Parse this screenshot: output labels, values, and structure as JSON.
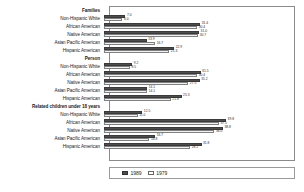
{
  "chart_data": {
    "type": "bar",
    "orientation": "horizontal",
    "title": "",
    "xlabel": "",
    "ylabel": "",
    "xlim": [
      0,
      60
    ],
    "grid": false,
    "legend_position": "bottom",
    "legend": [
      "1989",
      "1979"
    ],
    "series": [
      {
        "name": "1989",
        "color": "#4d4d4d"
      },
      {
        "name": "1979",
        "color": "#ffffff"
      }
    ],
    "groups": [
      {
        "header": "Families",
        "rows": [
          {
            "category": "Non-Hispanic White",
            "v1989": 7.0,
            "v1979": 6.0,
            "l1989": "7.0",
            "l1979": "6.0"
          },
          {
            "category": "African American",
            "v1989": 31.4,
            "v1979": 30.4,
            "l1989": "31.4",
            "l1979": "30.4"
          },
          {
            "category": "Native American",
            "v1989": 31.0,
            "v1979": 30.7,
            "l1989": "31.0",
            "l1979": "30.7"
          },
          {
            "category": "Asian Pacific American",
            "v1989": 13.9,
            "v1979": 16.7,
            "l1989": "13.9",
            "l1979": "16.7"
          },
          {
            "category": "Hispanic American",
            "v1989": 22.9,
            "v1979": 21.3,
            "l1989": "22.9",
            "l1979": "21.3"
          }
        ]
      },
      {
        "header": "Person",
        "rows": [
          {
            "category": "Non-Hispanic White",
            "v1989": 9.2,
            "v1979": 8.5,
            "l1989": "9.2",
            "l1979": "8.5"
          },
          {
            "category": "African American",
            "v1989": 31.5,
            "v1979": 30.4,
            "l1989": "31.5",
            "l1979": "30.4"
          },
          {
            "category": "Native American",
            "v1989": 31.2,
            "v1979": 27.5,
            "l1989": "31.2",
            "l1979": "27.5"
          },
          {
            "category": "Asian Pacific American",
            "v1989": 14.1,
            "v1979": 14.1,
            "l1989": "14.1",
            "l1979": "14.1"
          },
          {
            "category": "Hispanic American",
            "v1989": 25.3,
            "v1979": 21.8,
            "l1989": "25.3",
            "l1979": "21.8"
          }
        ]
      },
      {
        "header": "Related children under 18 years",
        "rows": [
          {
            "category": "Non-Hispanic White",
            "v1989": 12.5,
            "v1979": 11.0,
            "l1989": "12.5",
            "l1979": "11.0"
          },
          {
            "category": "African American",
            "v1989": 39.8,
            "v1979": 37.5,
            "l1989": "39.8",
            "l1979": "37.5"
          },
          {
            "category": "Native American",
            "v1989": 38.8,
            "v1979": 36.0,
            "l1989": "38.8",
            "l1979": "36.0"
          },
          {
            "category": "Asian Pacific American",
            "v1989": 16.7,
            "v1979": 14.8,
            "l1989": "16.7",
            "l1979": "14.8"
          },
          {
            "category": "Hispanic American",
            "v1989": 31.8,
            "v1979": 28.1,
            "l1989": "31.8",
            "l1979": "28.1"
          }
        ]
      }
    ]
  },
  "legend": {
    "items": [
      {
        "label": "1989",
        "swatch": "dark"
      },
      {
        "label": "1979",
        "swatch": "light"
      }
    ]
  }
}
